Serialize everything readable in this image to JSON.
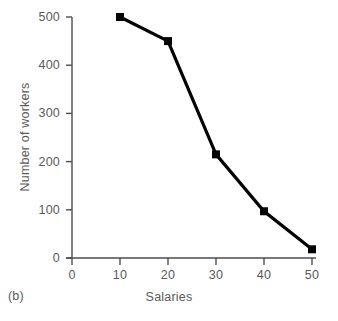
{
  "figure": {
    "caption": "(b)",
    "background_color": "#ffffff"
  },
  "chart_data": {
    "type": "line",
    "title": "",
    "subtitle": "",
    "xlabel": "Salaries",
    "ylabel": "Number of workers",
    "x": [
      10,
      20,
      30,
      40,
      50
    ],
    "values": [
      500,
      450,
      215,
      97,
      18
    ],
    "series": [
      {
        "name": "Number of workers",
        "x": [
          10,
          20,
          30,
          40,
          50
        ],
        "values": [
          500,
          450,
          215,
          97,
          18
        ]
      }
    ],
    "xlim": [
      0,
      50
    ],
    "ylim": [
      0,
      500
    ],
    "xticks": [
      0,
      10,
      20,
      30,
      40,
      50
    ],
    "yticks": [
      0,
      100,
      200,
      300,
      400,
      500
    ],
    "xtick_labels": [
      "0",
      "10",
      "20",
      "30",
      "40",
      "50"
    ],
    "ytick_labels": [
      "0",
      "100",
      "200",
      "300",
      "400",
      "500"
    ],
    "grid": false,
    "legend": false,
    "legend_position": "none",
    "marker": "square",
    "marker_color": "#000000",
    "line_color": "#000000",
    "line_width": 3,
    "axis_color": "#4d4d4d",
    "tick_label_color": "#5a5a5a",
    "annotations": []
  }
}
